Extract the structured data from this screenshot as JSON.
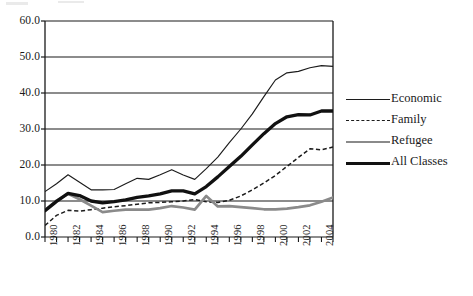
{
  "chart_data": {
    "type": "line",
    "title": "",
    "subtitle": "",
    "xlabel": "",
    "ylabel": "",
    "xlim": [
      1980,
      2005
    ],
    "ylim": [
      0.0,
      60.0
    ],
    "grid": true,
    "legend_position": "right",
    "y_ticks": [
      "60.0",
      "50.0",
      "40.0",
      "30.0",
      "20.0",
      "10.0",
      "0.0"
    ],
    "y_tick_values": [
      60.0,
      50.0,
      40.0,
      30.0,
      20.0,
      10.0,
      0.0
    ],
    "x_ticks": [
      "1980",
      "1982",
      "1984",
      "1986",
      "1988",
      "1990",
      "1992",
      "1994",
      "1996",
      "1998",
      "2000",
      "2002",
      "2004"
    ],
    "x_tick_values": [
      1980,
      1982,
      1984,
      1986,
      1988,
      1990,
      1992,
      1994,
      1996,
      1998,
      2000,
      2002,
      2004
    ],
    "x": [
      1980,
      1981,
      1982,
      1983,
      1984,
      1985,
      1986,
      1987,
      1988,
      1989,
      1990,
      1991,
      1992,
      1993,
      1994,
      1995,
      1996,
      1997,
      1998,
      1999,
      2000,
      2001,
      2002,
      2003,
      2004,
      2005
    ],
    "series": [
      {
        "name": "Economic",
        "style": "thin-solid",
        "color": "#1c1c1c",
        "values": [
          12.6,
          14.8,
          17.3,
          15.2,
          13.1,
          13.1,
          13.2,
          14.8,
          16.3,
          16.0,
          17.3,
          18.7,
          17.2,
          16.0,
          19.0,
          22.2,
          26.2,
          30.0,
          34.2,
          39.0,
          43.6,
          45.6,
          46.0,
          47.0,
          47.6,
          47.4
        ]
      },
      {
        "name": "Family",
        "style": "dashed",
        "color": "#1c1c1c",
        "values": [
          3.2,
          6.0,
          7.4,
          7.2,
          7.6,
          8.0,
          8.4,
          8.7,
          9.1,
          9.5,
          9.6,
          9.8,
          10.0,
          10.4,
          9.8,
          9.6,
          10.2,
          11.4,
          13.1,
          15.0,
          17.1,
          19.6,
          22.1,
          24.5,
          24.2,
          25.0
        ]
      },
      {
        "name": "Refugee",
        "style": "thick-gray",
        "color": "#8a8a8a",
        "values": [
          7.4,
          10.1,
          12.0,
          10.5,
          8.7,
          6.9,
          7.3,
          7.6,
          7.6,
          7.6,
          8.0,
          8.6,
          8.2,
          7.6,
          11.4,
          8.5,
          8.6,
          8.3,
          8.0,
          7.7,
          7.7,
          7.9,
          8.3,
          8.8,
          9.8,
          11.0
        ]
      },
      {
        "name": "All Classes",
        "style": "thick-black",
        "color": "#111111",
        "values": [
          7.3,
          9.9,
          12.1,
          11.5,
          10.0,
          9.5,
          9.8,
          10.3,
          11.0,
          11.4,
          12.0,
          12.8,
          12.8,
          12.0,
          14.0,
          16.7,
          19.6,
          22.4,
          25.6,
          28.7,
          31.5,
          33.4,
          34.0,
          33.9,
          35.0,
          35.0
        ]
      }
    ],
    "legend": [
      "Economic",
      "Family",
      "Refugee",
      "All Classes"
    ]
  },
  "legend": {
    "items": [
      {
        "label": "Economic",
        "swatch": "thin-solid-line-icon"
      },
      {
        "label": "Family",
        "swatch": "dashed-line-icon"
      },
      {
        "label": "Refugee",
        "swatch": "gray-line-icon"
      },
      {
        "label": "All Classes",
        "swatch": "bold-line-icon"
      }
    ]
  },
  "colors": {
    "axis": "#1a1a1a",
    "grid": "#1a1a1a",
    "economic": "#1c1c1c",
    "family": "#1c1c1c",
    "refugee": "#8a8a8a",
    "all_classes": "#111111",
    "background": "#ffffff"
  },
  "geometry": {
    "plot_left": 45,
    "plot_right": 333,
    "plot_top": 21,
    "plot_bottom": 237
  }
}
